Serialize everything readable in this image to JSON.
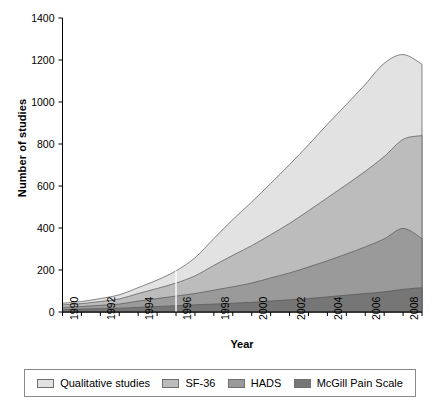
{
  "chart_data": {
    "type": "area",
    "stacked": true,
    "title": "",
    "xlabel": "Year",
    "ylabel": "Number of studies",
    "xlim": [
      1990,
      2009
    ],
    "ylim": [
      0,
      1400
    ],
    "yticks": [
      0,
      200,
      400,
      600,
      800,
      1000,
      1200,
      1400
    ],
    "ytick_labels": [
      "0",
      "200",
      "400",
      "600",
      "800",
      "1000",
      "1200",
      "1400"
    ],
    "xticks": [
      1990,
      1992,
      1994,
      1996,
      1998,
      2000,
      2002,
      2004,
      2006,
      2008
    ],
    "xtick_labels": [
      "1990",
      "1992",
      "1994",
      "1996",
      "1998",
      "2000",
      "2002",
      "2004",
      "2006",
      "2008"
    ],
    "x_minor_ticks": [
      1991,
      1993,
      1995,
      1997,
      1999,
      2001,
      2003,
      2005,
      2007,
      2009
    ],
    "grid": false,
    "legend_position": "bottom",
    "x": [
      1990,
      1991,
      1992,
      1993,
      1994,
      1995,
      1996,
      1997,
      1998,
      1999,
      2000,
      2001,
      2002,
      2003,
      2004,
      2005,
      2006,
      2007,
      2008,
      2009
    ],
    "series": [
      {
        "name": "McGill Pain Scale",
        "color": "#767676",
        "values": [
          12,
          14,
          16,
          18,
          22,
          26,
          30,
          34,
          38,
          42,
          46,
          52,
          58,
          64,
          72,
          80,
          88,
          96,
          108,
          116
        ]
      },
      {
        "name": "HADS",
        "color": "#9a9a9a",
        "values": [
          10,
          12,
          16,
          20,
          30,
          38,
          46,
          54,
          66,
          78,
          92,
          110,
          128,
          150,
          172,
          196,
          222,
          252,
          290,
          234
        ]
      },
      {
        "name": "SF-36",
        "color": "#bcbcbc",
        "values": [
          12,
          14,
          18,
          24,
          36,
          48,
          62,
          84,
          118,
          150,
          178,
          206,
          236,
          268,
          300,
          330,
          360,
          392,
          424,
          490
        ]
      },
      {
        "name": "Qualitative studies",
        "color": "#e2e2e2",
        "values": [
          8,
          10,
          14,
          20,
          28,
          40,
          58,
          86,
          128,
          170,
          208,
          244,
          280,
          314,
          350,
          382,
          414,
          444,
          404,
          340
        ]
      }
    ],
    "stack_tops": {
      "McGill Pain Scale": [
        12,
        14,
        16,
        18,
        22,
        26,
        30,
        34,
        38,
        42,
        46,
        52,
        58,
        64,
        72,
        80,
        88,
        96,
        108,
        116
      ],
      "HADS": [
        22,
        26,
        32,
        38,
        52,
        64,
        76,
        88,
        104,
        120,
        138,
        162,
        186,
        214,
        244,
        276,
        310,
        348,
        398,
        350
      ],
      "SF-36": [
        34,
        40,
        50,
        62,
        88,
        112,
        138,
        172,
        222,
        270,
        316,
        368,
        422,
        482,
        544,
        606,
        670,
        740,
        822,
        840
      ],
      "Qualitative studies": [
        42,
        50,
        64,
        82,
        116,
        152,
        196,
        258,
        350,
        440,
        524,
        612,
        702,
        796,
        894,
        988,
        1084,
        1184,
        1226,
        1180
      ]
    },
    "marker_line": {
      "year": 1996,
      "color": "#ffffff",
      "from_value": 0,
      "to_value": 196
    }
  },
  "legend": {
    "items": [
      {
        "label": "Qualitative studies",
        "color": "#e2e2e2"
      },
      {
        "label": "SF-36",
        "color": "#bcbcbc"
      },
      {
        "label": "HADS",
        "color": "#9a9a9a"
      },
      {
        "label": "McGill Pain Scale",
        "color": "#767676"
      }
    ]
  }
}
